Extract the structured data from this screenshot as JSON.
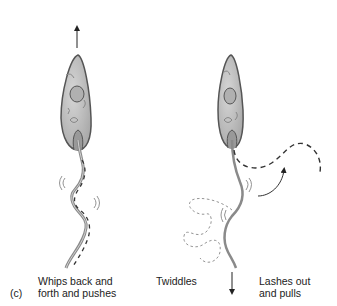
{
  "figure": {
    "panel_label": "(c)",
    "organisms": [
      {
        "name": "left-cell",
        "caption_line1": "Whips back and",
        "caption_line2": "forth and pushes",
        "motion_arrow": "up"
      },
      {
        "name": "right-cell",
        "caption_middle": "Twiddles",
        "caption_line1": "Lashes out",
        "caption_line2": "and pulls",
        "motion_arrow": "down"
      }
    ],
    "colors": {
      "cell_fill": "#bdbdbd",
      "cell_outline": "#555555",
      "flagellum": "#7a7a7a",
      "dashed": "#333333",
      "faint_dashed": "#888888"
    }
  }
}
